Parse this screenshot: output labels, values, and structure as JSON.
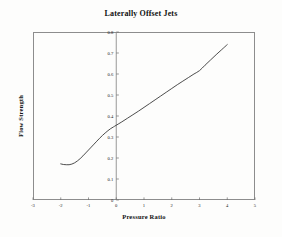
{
  "chart_data": {
    "type": "line",
    "title": "Laterally Offset Jets",
    "xlabel": "Pressure Ratio",
    "ylabel": "Flow Strength",
    "xlim": [
      -3,
      5
    ],
    "ylim": [
      0,
      0.8
    ],
    "xticks": [
      -3,
      -2,
      -1,
      0,
      1,
      2,
      3,
      4,
      5
    ],
    "xticklabels": [
      "-3",
      "-2",
      "-1",
      "0",
      "1",
      "2",
      "3",
      "4",
      "5"
    ],
    "yticks": [
      0,
      0.1,
      0.2,
      0.3,
      0.4,
      0.5,
      0.6,
      0.7,
      0.8
    ],
    "yticklabels": [
      "0",
      "0.1",
      "0.2",
      "0.3",
      "0.4",
      "0.5",
      "0.6",
      "0.7",
      "0.8"
    ],
    "grid": false,
    "legend": "none",
    "vertical_axis_at_x": 0,
    "series": [
      {
        "name": "Flow Strength",
        "color": "#2d2d2d",
        "x": [
          -2.0,
          -1.9,
          -1.8,
          -1.7,
          -1.6,
          -1.5,
          -1.4,
          -1.3,
          -1.2,
          -1.1,
          -1.0,
          -0.9,
          -0.8,
          -0.7,
          -0.6,
          -0.5,
          -0.4,
          -0.3,
          -0.2,
          -0.1,
          0.0,
          0.2,
          0.4,
          0.6,
          0.8,
          1.0,
          1.2,
          1.4,
          1.6,
          1.8,
          2.0,
          2.2,
          2.4,
          2.6,
          2.8,
          3.0,
          3.2,
          3.4,
          3.6,
          3.8,
          4.0
        ],
        "y": [
          0.172,
          0.169,
          0.168,
          0.168,
          0.171,
          0.177,
          0.186,
          0.197,
          0.21,
          0.224,
          0.238,
          0.252,
          0.266,
          0.28,
          0.294,
          0.307,
          0.319,
          0.33,
          0.34,
          0.348,
          0.356,
          0.372,
          0.389,
          0.406,
          0.423,
          0.441,
          0.459,
          0.477,
          0.495,
          0.513,
          0.531,
          0.549,
          0.566,
          0.583,
          0.6,
          0.616,
          0.642,
          0.667,
          0.692,
          0.716,
          0.74
        ]
      }
    ]
  },
  "figure": {
    "background_color": "#fdfdfc",
    "frame_color": "#8d8d8d"
  }
}
